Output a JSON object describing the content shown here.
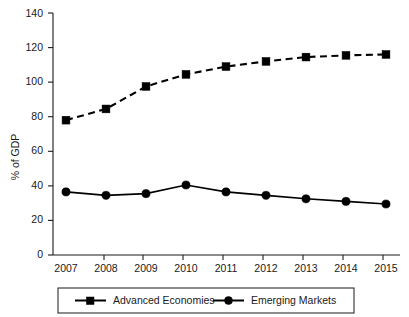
{
  "chart_data": {
    "type": "line",
    "title": "",
    "xlabel": "",
    "ylabel": "% of GDP",
    "categories": [
      "2007",
      "2008",
      "2009",
      "2010",
      "2011",
      "2012",
      "2013",
      "2014",
      "2015"
    ],
    "x": [
      2007,
      2008,
      2009,
      2010,
      2011,
      2012,
      2013,
      2014,
      2015
    ],
    "ylim": [
      0,
      140
    ],
    "yticks": [
      0,
      20,
      40,
      60,
      80,
      100,
      120,
      140
    ],
    "ytick_labels": [
      "0",
      "20",
      "40",
      "60",
      "80",
      "100",
      "120",
      "140"
    ],
    "grid": false,
    "legend_position": "bottom",
    "series": [
      {
        "name": "Advanced Economies",
        "marker": "square",
        "linestyle": "dashed",
        "color": "#000000",
        "values": [
          78,
          84.5,
          97.5,
          104.5,
          109,
          112,
          114.5,
          115.5,
          116
        ]
      },
      {
        "name": "Emerging Markets",
        "marker": "circle",
        "linestyle": "solid",
        "color": "#000000",
        "values": [
          36.5,
          34.5,
          35.5,
          40.5,
          36.5,
          34.5,
          32.5,
          31,
          29.5
        ]
      }
    ]
  },
  "axis": {
    "y_axis_title": "% of GDP",
    "y_tick_0": "0",
    "y_tick_20": "20",
    "y_tick_40": "40",
    "y_tick_60": "60",
    "y_tick_80": "80",
    "y_tick_100": "100",
    "y_tick_120": "120",
    "y_tick_140": "140",
    "x_tick_2007": "2007",
    "x_tick_2008": "2008",
    "x_tick_2009": "2009",
    "x_tick_2010": "2010",
    "x_tick_2011": "2011",
    "x_tick_2012": "2012",
    "x_tick_2013": "2013",
    "x_tick_2014": "2014",
    "x_tick_2015": "2015"
  },
  "legend": {
    "entries": [
      {
        "label": "Advanced Economies",
        "marker": "square-marker-icon"
      },
      {
        "label": "Emerging Markets",
        "marker": "circle-marker-icon"
      }
    ]
  }
}
